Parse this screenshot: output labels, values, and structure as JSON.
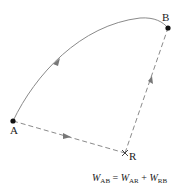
{
  "diagram": {
    "points": {
      "A": {
        "label": "A",
        "x": 13,
        "y": 121
      },
      "B": {
        "label": "B",
        "x": 168,
        "y": 28
      },
      "R": {
        "label": "R",
        "x": 125,
        "y": 153
      }
    },
    "paths": [
      {
        "name": "curved-path-A-to-B",
        "style": "solid",
        "from": "A",
        "to": "B"
      },
      {
        "name": "dashed-path-A-to-R",
        "style": "dashed",
        "from": "A",
        "to": "R"
      },
      {
        "name": "dashed-path-R-to-B",
        "style": "dashed",
        "from": "R",
        "to": "B"
      }
    ],
    "equation": {
      "lhs": "W",
      "lhs_sub": "AB",
      "eq": " = ",
      "t1": "W",
      "t1_sub": "AR",
      "plus": " + ",
      "t2": "W",
      "t2_sub": "RB"
    },
    "colors": {
      "line": "#8a8a8a",
      "point": "#111111",
      "arrow": "#777777"
    }
  }
}
